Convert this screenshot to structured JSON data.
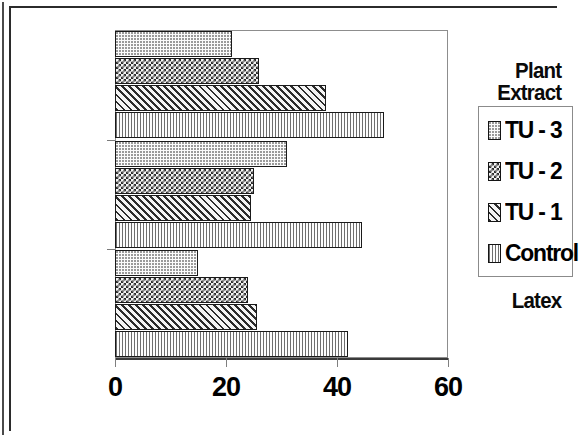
{
  "chart_data": {
    "type": "bar",
    "orientation": "horizontal",
    "title": "",
    "xlabel": "",
    "ylabel": "",
    "xlim": [
      0,
      60
    ],
    "xticks": [
      0,
      20,
      40,
      60
    ],
    "xtick_labels": [
      "0",
      "20",
      "40",
      "60"
    ],
    "grid": false,
    "legend_position": "right",
    "categories": [
      "Plant Extract",
      "L +supl",
      "Latex"
    ],
    "category_label_lines": [
      [
        "Plant",
        "Extract"
      ],
      [
        "L +supl"
      ],
      [
        "Latex"
      ]
    ],
    "series": [
      {
        "name": "TU - 3",
        "pattern": "dotted",
        "values": [
          21,
          31,
          15
        ]
      },
      {
        "name": "TU - 2",
        "pattern": "checkerboard",
        "values": [
          26,
          25,
          24
        ]
      },
      {
        "name": "TU - 1",
        "pattern": "diagonal-hatch",
        "values": [
          38,
          24.5,
          25.5
        ]
      },
      {
        "name": "Control",
        "pattern": "vertical-lines",
        "values": [
          48.5,
          44.5,
          42
        ]
      }
    ]
  },
  "legend": {
    "entries": [
      {
        "label": "TU - 3",
        "swatch": "tu3-swatch-icon"
      },
      {
        "label": "TU - 2",
        "swatch": "tu2-swatch-icon"
      },
      {
        "label": "TU - 1",
        "swatch": "tu1-swatch-icon"
      },
      {
        "label": "Control",
        "swatch": "control-swatch-icon"
      }
    ]
  },
  "colors": {
    "plot_border": "#8d8d8d",
    "axis": "#3a3a3a",
    "bar_outline": "#1a1a1a",
    "text": "#000000",
    "page_frame": "#2b2b2b",
    "background": "#ffffff"
  }
}
